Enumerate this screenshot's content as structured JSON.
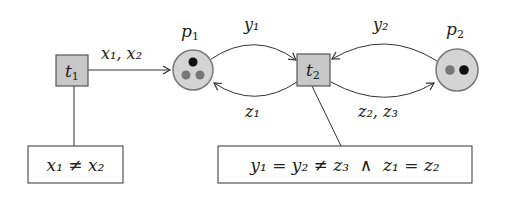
{
  "diagram": {
    "type": "petri-net",
    "transitions": [
      {
        "id": "t1",
        "label": "t",
        "sub": "1"
      },
      {
        "id": "t2",
        "label": "t",
        "sub": "2"
      }
    ],
    "places": [
      {
        "id": "p1",
        "label": "p",
        "sub": "1",
        "tokens": [
          {
            "color": "#111111"
          },
          {
            "color": "#777777"
          },
          {
            "color": "#777777"
          }
        ]
      },
      {
        "id": "p2",
        "label": "p",
        "sub": "2",
        "tokens": [
          {
            "color": "#777777"
          },
          {
            "color": "#111111"
          }
        ]
      }
    ],
    "arcs": [
      {
        "id": "t1-p1",
        "from": "t1",
        "to": "p1",
        "label": "x₁, x₂"
      },
      {
        "id": "p1-t2",
        "from": "p1",
        "to": "t2",
        "label": "y₁"
      },
      {
        "id": "t2-p1",
        "from": "t2",
        "to": "p1",
        "label": "z₁"
      },
      {
        "id": "p2-t2",
        "from": "p2",
        "to": "t2",
        "label": "y₂"
      },
      {
        "id": "t2-p2",
        "from": "t2",
        "to": "p2",
        "label": "z₂, z₃"
      }
    ],
    "guards": [
      {
        "transition": "t1",
        "text": "x₁ ≠ x₂"
      },
      {
        "transition": "t2",
        "text": "y₁ = y₂ ≠ z₃  ∧  z₁ = z₂"
      }
    ],
    "colors": {
      "node_fill": "#c8c8c8",
      "place_fill": "#d4d4d4",
      "stroke": "#555555",
      "line": "#333333"
    }
  }
}
